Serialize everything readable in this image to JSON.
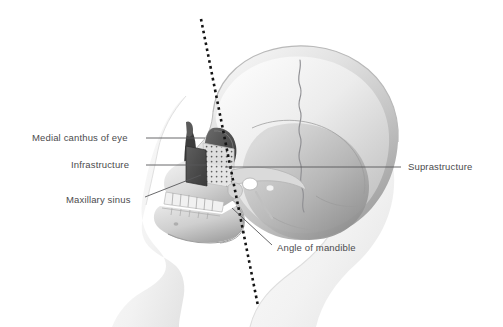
{
  "figure": {
    "background_color": "#ffffff",
    "label_color": "#4b4b4d",
    "leader_color": "#58585a",
    "reference_line": {
      "name": "dotted-reference-line",
      "style": "dotted",
      "color": "#141414",
      "x1": 201,
      "y1": 19,
      "x2": 258,
      "y2": 306
    },
    "labels": [
      {
        "id": "medial-canthus-of-eye",
        "text": "Medial canthus of eye",
        "side": "left",
        "text_x": 32,
        "text_y": 132,
        "leader": {
          "x1": 146,
          "y1": 138,
          "x2": 205,
          "y2": 138
        }
      },
      {
        "id": "infrastructure",
        "text": "Infrastructure",
        "side": "left",
        "text_x": 71,
        "text_y": 159,
        "leader": {
          "x1": 146,
          "y1": 165,
          "x2": 207,
          "y2": 165
        }
      },
      {
        "id": "maxillary-sinus",
        "text": "Maxillary sinus",
        "side": "left",
        "text_x": 66,
        "text_y": 194,
        "leader": {
          "x1": 145,
          "y1": 197,
          "x2": 201,
          "y2": 175
        }
      },
      {
        "id": "suprastructure",
        "text": "Suprastructure",
        "side": "right",
        "text_x": 408,
        "text_y": 161,
        "leader": {
          "x1": 225,
          "y1": 167,
          "x2": 401,
          "y2": 167
        }
      },
      {
        "id": "angle-of-mandible",
        "text": "Angle of mandible",
        "side": "right",
        "text_x": 277,
        "text_y": 242,
        "leader": {
          "x1": 232,
          "y1": 208,
          "x2": 272,
          "y2": 245
        }
      }
    ],
    "anatomy": {
      "cranium": "cranial-vault",
      "suture": "coronal-suture",
      "orbit": "eye-orbit",
      "nasal_cavity": "nasal-aperture",
      "maxilla": "upper-teeth-row",
      "mandible": "lower-jaw",
      "zygomatic_arch": "zygomatic-arch",
      "ear_canal": "external-auditory-meatus",
      "soft_tissue": "facial-soft-tissue-profile",
      "infrastructure_zone": "dark-quadrilateral-implant-zone",
      "suprastructure_zone": "stippled-implant-zone"
    }
  }
}
